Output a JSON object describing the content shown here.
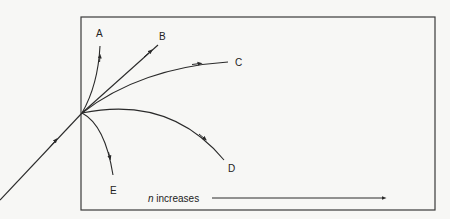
{
  "diagram": {
    "labels": {
      "A": "A",
      "B": "B",
      "C": "C",
      "D": "D",
      "E": "E"
    },
    "axis_label": {
      "italic": "n",
      "rest": " increases"
    },
    "colors": {
      "line": "#2a2a2a",
      "background": "#f7f7f5"
    }
  }
}
